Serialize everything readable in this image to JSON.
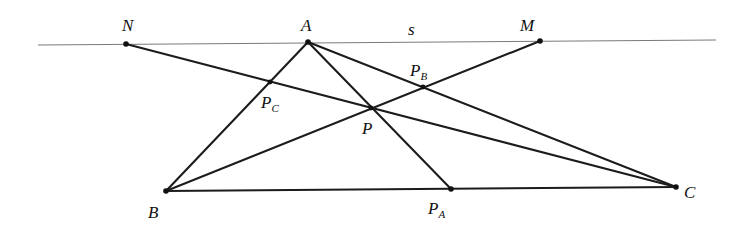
{
  "diagram": {
    "line_s": {
      "label": "s",
      "x1": 38,
      "y1": 45,
      "x2": 716,
      "y2": 40,
      "label_pos": {
        "x": 408,
        "y": 35
      }
    },
    "points": {
      "N": {
        "label": "N",
        "sub": "",
        "x": 126,
        "y": 44,
        "lx": 122,
        "ly": 31
      },
      "A": {
        "label": "A",
        "sub": "",
        "x": 308,
        "y": 42,
        "lx": 301,
        "ly": 31
      },
      "M": {
        "label": "M",
        "sub": "",
        "x": 540,
        "y": 41,
        "lx": 520,
        "ly": 31
      },
      "B": {
        "label": "B",
        "sub": "",
        "x": 166,
        "y": 191,
        "lx": 148,
        "ly": 218
      },
      "C": {
        "label": "C",
        "sub": "",
        "x": 676,
        "y": 187,
        "lx": 684,
        "ly": 198
      },
      "P": {
        "label": "P",
        "sub": "",
        "x": 371,
        "y": 108,
        "lx": 362,
        "ly": 134
      },
      "PA": {
        "label": "P",
        "sub": "A",
        "x": 451,
        "y": 189,
        "lx": 428,
        "ly": 214
      },
      "PB": {
        "label": "P",
        "sub": "B",
        "x": 423,
        "y": 87,
        "lx": 410,
        "ly": 76
      },
      "PC": {
        "label": "P",
        "sub": "C",
        "x": 270,
        "y": 82,
        "lx": 261,
        "ly": 108
      }
    },
    "segments": [
      {
        "from": "A",
        "to": "B"
      },
      {
        "from": "A",
        "to": "C"
      },
      {
        "from": "B",
        "to": "C"
      },
      {
        "from": "A",
        "to": "PA"
      },
      {
        "from": "B",
        "to": "M"
      },
      {
        "from": "N",
        "to": "C"
      }
    ],
    "colors": {
      "line": "#1c1c1c",
      "thin_line": "#7a7a7a",
      "point": "#111111",
      "background": "#ffffff"
    }
  }
}
